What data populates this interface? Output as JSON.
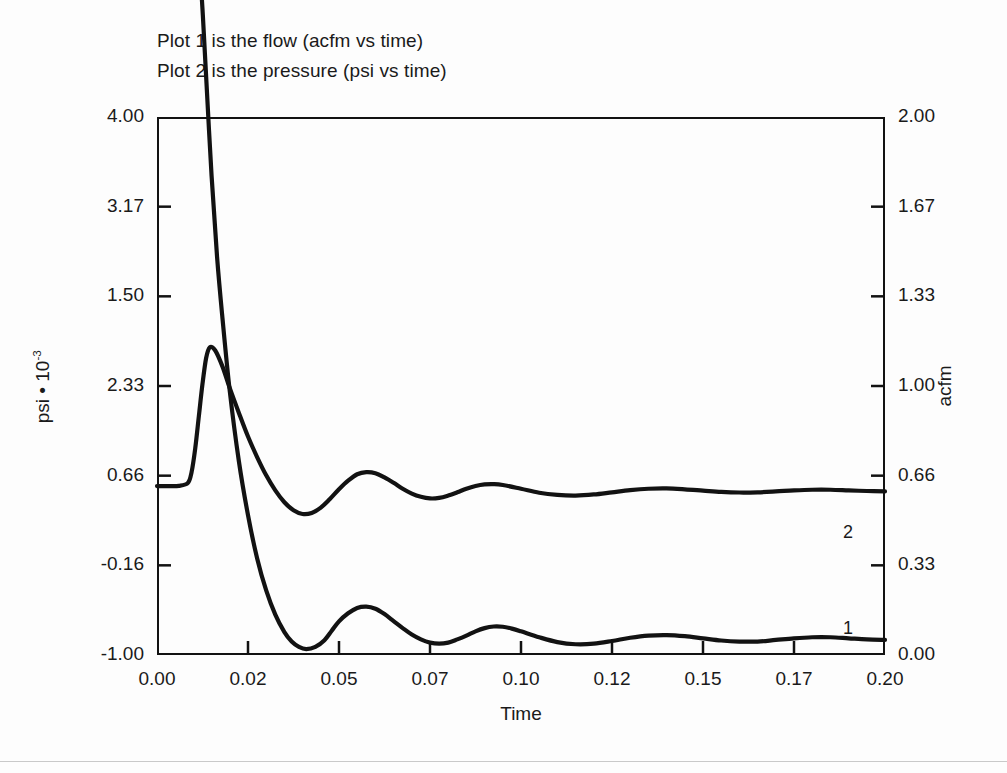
{
  "legend": {
    "lines": [
      "Plot 1 is the flow (acfm vs time)",
      "Plot 2 is the pressure (psi vs time)"
    ]
  },
  "axis_titles": {
    "x": "Time",
    "y_left_prefix": "psi • 10",
    "y_left_exponent": "-3",
    "y_right": "acfm"
  },
  "series_tags": {
    "flow": "1",
    "pressure": "2"
  },
  "chart_data": {
    "type": "line",
    "title": "",
    "subtitle": "",
    "annotations": [
      "Plot 1 is the flow (acfm vs time)",
      "Plot 2 is the pressure (psi vs time)"
    ],
    "xlabel": "Time",
    "ylabel": "psi • 10^-3",
    "y2label": "acfm",
    "grid": false,
    "legend_position": "inline-right-end-labels",
    "xlim": [
      0.0,
      0.2
    ],
    "xticks": [
      0.0,
      0.02,
      0.05,
      0.07,
      0.1,
      0.12,
      0.15,
      0.17,
      0.2
    ],
    "xticklabels": [
      "0.00",
      "0.02",
      "0.05",
      "0.07",
      "0.10",
      "0.12",
      "0.15",
      "0.17",
      "0.20"
    ],
    "ylim_left": [
      -1.0,
      4.0
    ],
    "yticks_left_labels": [
      "4.00",
      "3.17",
      "1.50",
      "2.33",
      "0.66",
      "-0.16",
      "-1.00"
    ],
    "ylim_right": [
      0.0,
      2.0
    ],
    "yticks_right_labels": [
      "2.00",
      "1.67",
      "1.33",
      "1.00",
      "0.66",
      "0.33",
      "0.00"
    ],
    "series": [
      {
        "name": "1",
        "label": "Plot 1 is the flow (acfm vs time)",
        "axis": "right",
        "units": "acfm",
        "color": "#121212",
        "x": [
          0.0,
          0.004,
          0.008,
          0.0105,
          0.0115,
          0.0125,
          0.0135,
          0.015,
          0.0165,
          0.018,
          0.02,
          0.0225,
          0.025,
          0.0275,
          0.03,
          0.0325,
          0.035,
          0.037,
          0.039,
          0.041,
          0.0435,
          0.046,
          0.048,
          0.05,
          0.0525,
          0.055,
          0.0575,
          0.06,
          0.0625,
          0.065,
          0.0675,
          0.07,
          0.0725,
          0.075,
          0.0775,
          0.08,
          0.0825,
          0.085,
          0.0875,
          0.09,
          0.0925,
          0.095,
          0.0975,
          0.1,
          0.105,
          0.11,
          0.115,
          0.12,
          0.125,
          0.13,
          0.135,
          0.14,
          0.145,
          0.15,
          0.155,
          0.16,
          0.165,
          0.17,
          0.175,
          0.18,
          0.185,
          0.19,
          0.195,
          0.2
        ],
        "y": [
          2.735,
          2.735,
          2.73,
          2.7,
          2.6,
          2.4,
          2.15,
          1.78,
          1.48,
          1.25,
          0.98,
          0.72,
          0.52,
          0.36,
          0.24,
          0.15,
          0.085,
          0.05,
          0.03,
          0.022,
          0.03,
          0.055,
          0.09,
          0.125,
          0.155,
          0.175,
          0.18,
          0.172,
          0.152,
          0.126,
          0.1,
          0.076,
          0.058,
          0.046,
          0.042,
          0.046,
          0.058,
          0.072,
          0.088,
          0.1,
          0.106,
          0.105,
          0.098,
          0.088,
          0.066,
          0.048,
          0.04,
          0.042,
          0.052,
          0.064,
          0.072,
          0.074,
          0.07,
          0.062,
          0.054,
          0.05,
          0.05,
          0.056,
          0.062,
          0.066,
          0.066,
          0.062,
          0.058,
          0.056
        ]
      },
      {
        "name": "2",
        "label": "Plot 2 is the pressure (psi vs time)",
        "axis": "left",
        "units": "psi*10^-3",
        "color": "#121212",
        "x": [
          0.0,
          0.003,
          0.006,
          0.0085,
          0.0095,
          0.0105,
          0.0115,
          0.0125,
          0.0135,
          0.0145,
          0.016,
          0.018,
          0.02,
          0.0225,
          0.025,
          0.0275,
          0.03,
          0.0325,
          0.035,
          0.0375,
          0.04,
          0.0425,
          0.045,
          0.0475,
          0.05,
          0.0525,
          0.055,
          0.0575,
          0.06,
          0.0625,
          0.065,
          0.0675,
          0.07,
          0.0725,
          0.075,
          0.0775,
          0.08,
          0.0825,
          0.085,
          0.0875,
          0.09,
          0.0925,
          0.095,
          0.1,
          0.105,
          0.11,
          0.115,
          0.12,
          0.125,
          0.13,
          0.135,
          0.14,
          0.145,
          0.15,
          0.155,
          0.16,
          0.165,
          0.17,
          0.175,
          0.18,
          0.185,
          0.19,
          0.195,
          0.2
        ],
        "y": [
          0.57,
          0.57,
          0.572,
          0.6,
          0.7,
          0.92,
          1.22,
          1.52,
          1.76,
          1.86,
          1.83,
          1.68,
          1.48,
          1.25,
          1.03,
          0.84,
          0.67,
          0.53,
          0.42,
          0.345,
          0.31,
          0.32,
          0.37,
          0.45,
          0.54,
          0.62,
          0.68,
          0.7,
          0.69,
          0.65,
          0.6,
          0.545,
          0.5,
          0.47,
          0.455,
          0.46,
          0.482,
          0.512,
          0.545,
          0.57,
          0.585,
          0.588,
          0.58,
          0.545,
          0.508,
          0.488,
          0.482,
          0.492,
          0.512,
          0.532,
          0.545,
          0.548,
          0.54,
          0.528,
          0.516,
          0.51,
          0.512,
          0.52,
          0.53,
          0.536,
          0.536,
          0.53,
          0.524,
          0.52
        ]
      }
    ]
  }
}
